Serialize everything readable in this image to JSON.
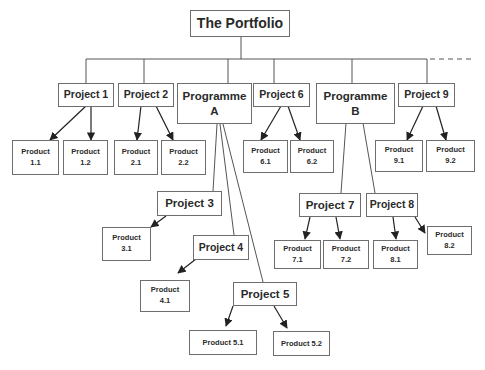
{
  "diagram": {
    "root": {
      "id": "portfolio",
      "label": "The Portfolio"
    },
    "level1": [
      {
        "id": "project-1",
        "label": "Project 1",
        "type": "project"
      },
      {
        "id": "project-2",
        "label": "Project 2",
        "type": "project"
      },
      {
        "id": "programme-a",
        "label": "Programme\nA",
        "type": "programme"
      },
      {
        "id": "project-6",
        "label": "Project 6",
        "type": "project"
      },
      {
        "id": "programme-b",
        "label": "Programme\nB",
        "type": "programme"
      },
      {
        "id": "project-9",
        "label": "Project 9",
        "type": "project"
      }
    ],
    "programme_projects": [
      {
        "id": "project-3",
        "label": "Project 3",
        "parent": "programme-a"
      },
      {
        "id": "project-4",
        "label": "Project 4",
        "parent": "programme-a"
      },
      {
        "id": "project-5",
        "label": "Project 5",
        "parent": "programme-a"
      },
      {
        "id": "project-7",
        "label": "Project 7",
        "parent": "programme-b"
      },
      {
        "id": "project-8",
        "label": "Project 8",
        "parent": "programme-b"
      }
    ],
    "products": [
      {
        "id": "product-1-1",
        "label": "Product\n1.1",
        "parent": "project-1"
      },
      {
        "id": "product-1-2",
        "label": "Product\n1.2",
        "parent": "project-1"
      },
      {
        "id": "product-2-1",
        "label": "Product\n2.1",
        "parent": "project-2"
      },
      {
        "id": "product-2-2",
        "label": "Product\n2.2",
        "parent": "project-2"
      },
      {
        "id": "product-6-1",
        "label": "Product\n6.1",
        "parent": "project-6"
      },
      {
        "id": "product-6-2",
        "label": "Product\n6.2",
        "parent": "project-6"
      },
      {
        "id": "product-9-1",
        "label": "Product\n9.1",
        "parent": "project-9"
      },
      {
        "id": "product-9-2",
        "label": "Product\n9.2",
        "parent": "project-9"
      },
      {
        "id": "product-3-1",
        "label": "Product\n3.1",
        "parent": "project-3"
      },
      {
        "id": "product-4-1",
        "label": "Product\n4.1",
        "parent": "project-4"
      },
      {
        "id": "product-5-1",
        "label": "Product 5.1",
        "parent": "project-5"
      },
      {
        "id": "product-5-2",
        "label": "Product 5.2",
        "parent": "project-5"
      },
      {
        "id": "product-7-1",
        "label": "Product\n7.1",
        "parent": "project-7"
      },
      {
        "id": "product-7-2",
        "label": "Product\n7.2",
        "parent": "project-7"
      },
      {
        "id": "product-8-1",
        "label": "Product\n8.1",
        "parent": "project-8"
      },
      {
        "id": "product-8-2",
        "label": "Product\n8.2",
        "parent": "project-8"
      }
    ],
    "continuation": "dashed line to the right indicating more items",
    "colors": {
      "line": "#555555",
      "box_border": "#6e6e6e",
      "text": "#2a2a2a",
      "background": "#ffffff"
    }
  }
}
